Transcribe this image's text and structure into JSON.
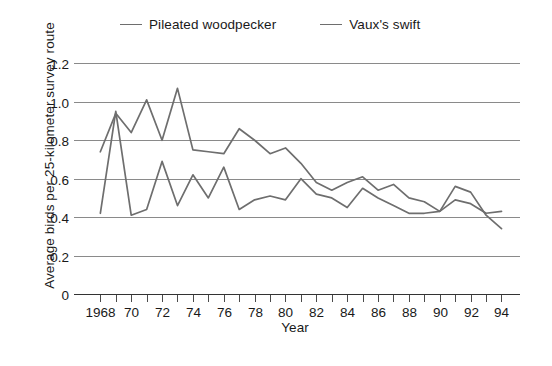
{
  "chart_data": {
    "type": "line",
    "title": "",
    "xlabel": "Year",
    "ylabel": "Average birds per 25-kilometer survey route",
    "xlim": [
      1967.2,
      1995.2
    ],
    "ylim": [
      0,
      1.28
    ],
    "grid": true,
    "legend_position": "top",
    "ytick_values": [
      0,
      0.2,
      0.4,
      0.6,
      0.8,
      1.0,
      1.2
    ],
    "ytick_labels": [
      "0",
      "0.2",
      "0.4",
      "0.6",
      "0.8",
      "1.0",
      "1.2"
    ],
    "xtick_values": [
      1968,
      1969,
      1970,
      1971,
      1972,
      1973,
      1974,
      1975,
      1976,
      1977,
      1978,
      1979,
      1980,
      1981,
      1982,
      1983,
      1984,
      1985,
      1986,
      1987,
      1988,
      1989,
      1990,
      1991,
      1992,
      1993,
      1994
    ],
    "xtick_labels": [
      "1968",
      "",
      "70",
      "",
      "72",
      "",
      "74",
      "",
      "76",
      "",
      "78",
      "",
      "80",
      "",
      "82",
      "",
      "84",
      "",
      "86",
      "",
      "88",
      "",
      "90",
      "",
      "92",
      "",
      "94"
    ],
    "x": [
      1968,
      1969,
      1970,
      1971,
      1972,
      1973,
      1974,
      1975,
      1976,
      1977,
      1978,
      1979,
      1980,
      1981,
      1982,
      1983,
      1984,
      1985,
      1986,
      1987,
      1988,
      1989,
      1990,
      1991,
      1992,
      1993,
      1994
    ],
    "series": [
      {
        "name": "Pileated woodpecker",
        "color": "#6e6e6e",
        "values": [
          0.42,
          0.95,
          0.41,
          0.44,
          0.69,
          0.46,
          0.62,
          0.5,
          0.66,
          0.44,
          0.49,
          0.51,
          0.49,
          0.6,
          0.52,
          0.5,
          0.45,
          0.55,
          0.5,
          0.46,
          0.42,
          0.42,
          0.43,
          0.49,
          0.47,
          0.42,
          0.43
        ]
      },
      {
        "name": "Vaux's swift",
        "color": "#6e6e6e",
        "values": [
          0.74,
          0.94,
          0.84,
          1.01,
          0.8,
          1.07,
          0.75,
          0.74,
          0.73,
          0.86,
          0.8,
          0.73,
          0.76,
          0.68,
          0.58,
          0.54,
          0.58,
          0.61,
          0.54,
          0.57,
          0.5,
          0.48,
          0.43,
          0.56,
          0.53,
          0.41,
          0.34
        ]
      }
    ]
  },
  "legend": {
    "entries": [
      {
        "label": "Pileated woodpecker"
      },
      {
        "label": "Vaux's swift"
      }
    ]
  },
  "axes": {
    "x_title": "Year",
    "y_title": "Average birds per 25-kilometer survey route"
  }
}
